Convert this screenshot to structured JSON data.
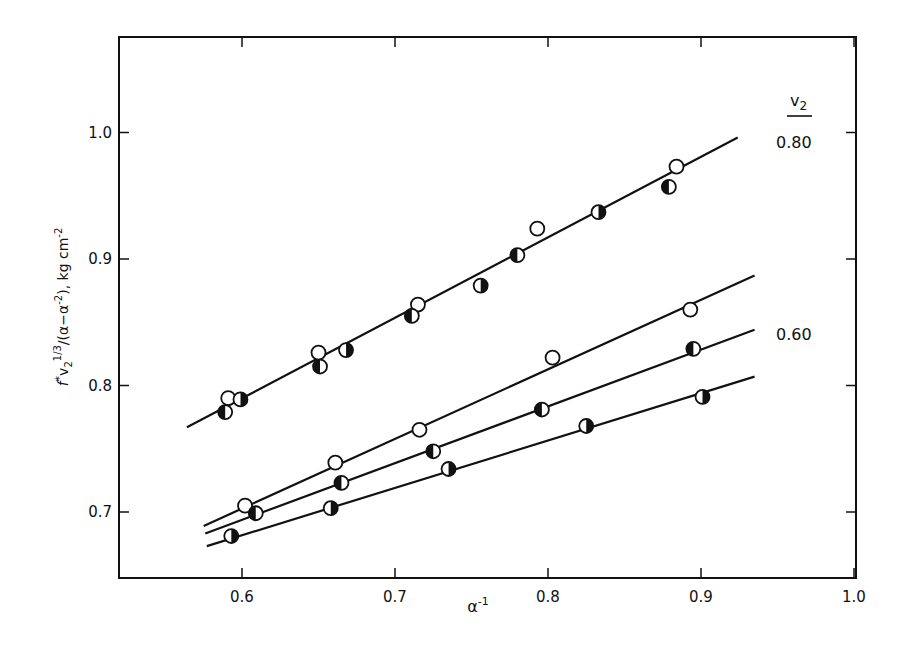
{
  "chart_data": {
    "type": "scatter",
    "title": "",
    "xlabel": "α⁻¹",
    "ylabel": "f*v₂^(1/3)/(α−α⁻²), kg cm⁻²",
    "xlim": [
      0.52,
      1.0
    ],
    "ylim": [
      0.649,
      1.076
    ],
    "x_ticks": [
      0.6,
      0.7,
      0.8,
      0.9,
      1.0
    ],
    "x_tick_labels": [
      "0.6",
      "0.7",
      "0.8",
      "0.9",
      "1.0"
    ],
    "y_ticks": [
      0.7,
      0.8,
      0.9,
      1.0
    ],
    "y_tick_labels": [
      "0.7",
      "0.8",
      "0.9",
      "1.0"
    ],
    "grid": false,
    "legend_title": "v₂",
    "annotations": [
      {
        "text": "0.80",
        "near": "upper line",
        "x_px": 798,
        "y_px": 147
      },
      {
        "text": "0.60",
        "near": "lower line group",
        "x_px": 798,
        "y_px": 340
      }
    ],
    "marker_types": {
      "open": "open circle",
      "left_black": "circle with left half filled",
      "right_black": "circle with right half filled"
    },
    "series": [
      {
        "name": "v2=0.80 open",
        "group": "0.80",
        "marker": "open",
        "x": [
          0.591,
          0.65,
          0.715,
          0.793,
          0.884
        ],
        "y": [
          0.79,
          0.826,
          0.864,
          0.924,
          0.973
        ]
      },
      {
        "name": "v2=0.80 left-half filled",
        "group": "0.80",
        "marker": "left_black",
        "x": [
          0.589,
          0.651,
          0.711,
          0.78,
          0.879
        ],
        "y": [
          0.779,
          0.815,
          0.855,
          0.903,
          0.957
        ]
      },
      {
        "name": "v2=0.80 right-half filled",
        "group": "0.80",
        "marker": "right_black",
        "x": [
          0.599,
          0.668,
          0.756,
          0.833
        ],
        "y": [
          0.789,
          0.828,
          0.879,
          0.937
        ]
      },
      {
        "name": "v2=0.60 open",
        "group": "0.60",
        "marker": "open",
        "x": [
          0.602,
          0.661,
          0.716,
          0.803,
          0.893
        ],
        "y": [
          0.705,
          0.739,
          0.765,
          0.822,
          0.86
        ]
      },
      {
        "name": "v2=0.60 left-half filled",
        "group": "0.60",
        "marker": "left_black",
        "x": [
          0.609,
          0.665,
          0.725,
          0.796,
          0.895
        ],
        "y": [
          0.699,
          0.723,
          0.748,
          0.781,
          0.829
        ]
      },
      {
        "name": "v2=0.60 right-half filled",
        "group": "0.60",
        "marker": "right_black",
        "x": [
          0.593,
          0.658,
          0.735,
          0.825,
          0.901
        ],
        "y": [
          0.681,
          0.703,
          0.734,
          0.768,
          0.791
        ]
      }
    ],
    "fit_lines": [
      {
        "name": "0.80 fit",
        "x": [
          0.564,
          0.924
        ],
        "y": [
          0.767,
          0.996
        ]
      },
      {
        "name": "0.60 fit (open)",
        "x": [
          0.575,
          0.935
        ],
        "y": [
          0.689,
          0.887
        ]
      },
      {
        "name": "0.60 fit (left-half filled)",
        "x": [
          0.576,
          0.935
        ],
        "y": [
          0.683,
          0.844
        ]
      },
      {
        "name": "0.60 fit (right-half filled)",
        "x": [
          0.577,
          0.935
        ],
        "y": [
          0.673,
          0.807
        ]
      }
    ]
  },
  "labels": {
    "x_axis": "α",
    "x_axis_sup": "-1",
    "y_axis_main": "f*v",
    "legend_title_main": "v",
    "legend_title_sub": "2",
    "group_080": "0.80",
    "group_060": "0.60"
  },
  "colors": {
    "ink": "#111111",
    "background": "#ffffff"
  }
}
